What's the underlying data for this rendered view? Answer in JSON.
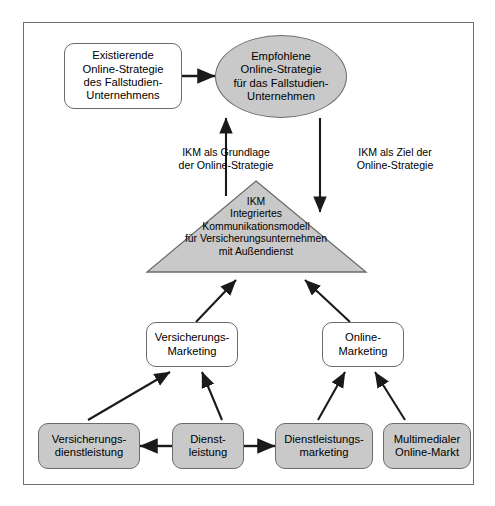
{
  "diagram": {
    "title_hidden": "",
    "colors": {
      "frame_border": "#6d6d6d",
      "node_border": "#6b6b6b",
      "gray_fill": "#c9c9c9",
      "white_fill": "#ffffff",
      "stroke": "#1a1a1a",
      "background": "#ffffff"
    },
    "nodes": {
      "existing_strategy": {
        "label": "Existierende\nOnline-Strategie\ndes Fallstudien-\nUnternehmens",
        "shape": "rounded-rect",
        "fill": "white"
      },
      "recommended_strategy": {
        "label": "Empfohlene\nOnline-Strategie\nfür das Fallstudien-\nUnternehmen",
        "shape": "ellipse",
        "fill": "gray"
      },
      "ikm_triangle": {
        "label": "IKM\nIntegriertes\nKommunikationsmodell\nfür Versicherungsunternehmen\nmit Außendienst",
        "shape": "triangle",
        "fill": "gray"
      },
      "versicherungs_marketing": {
        "label": "Versicherungs-\nMarketing",
        "shape": "rounded-rect",
        "fill": "white"
      },
      "online_marketing": {
        "label": "Online-\nMarketing",
        "shape": "rounded-rect",
        "fill": "white"
      },
      "versicherungsdienstleistung": {
        "label": "Versicherungs-\ndienstleistung",
        "shape": "rounded-rect",
        "fill": "gray"
      },
      "dienstleistung": {
        "label": "Dienst-\nleistung",
        "shape": "rounded-rect",
        "fill": "gray"
      },
      "dienstleistungsmarketing": {
        "label": "Dienstleistungs-\nmarketing",
        "shape": "rounded-rect",
        "fill": "gray"
      },
      "multimedialer_online_markt": {
        "label": "Multimedialer\nOnline-Markt",
        "shape": "rounded-rect",
        "fill": "gray"
      }
    },
    "edge_labels": {
      "left": "IKM als Grundlage\nder Online-Strategie",
      "right": "IKM als Ziel der\nOnline-Strategie"
    },
    "edges": [
      {
        "from": "existing_strategy",
        "to": "recommended_strategy",
        "direction": "right"
      },
      {
        "from": "ikm_triangle",
        "to": "recommended_strategy",
        "direction": "up",
        "label": "IKM als Grundlage der Online-Strategie"
      },
      {
        "from": "recommended_strategy",
        "to": "ikm_triangle",
        "direction": "down",
        "label": "IKM als Ziel der Online-Strategie"
      },
      {
        "from": "versicherungs_marketing",
        "to": "ikm_triangle",
        "direction": "up-right"
      },
      {
        "from": "online_marketing",
        "to": "ikm_triangle",
        "direction": "up-left"
      },
      {
        "from": "versicherungsdienstleistung",
        "to": "versicherungs_marketing",
        "direction": "up-right"
      },
      {
        "from": "dienstleistung",
        "to": "versicherungs_marketing",
        "direction": "up-left"
      },
      {
        "from": "dienstleistungsmarketing",
        "to": "online_marketing",
        "direction": "up-right"
      },
      {
        "from": "multimedialer_online_markt",
        "to": "online_marketing",
        "direction": "up-left"
      },
      {
        "from": "dienstleistung",
        "to": "versicherungsdienstleistung",
        "direction": "left"
      },
      {
        "from": "dienstleistung",
        "to": "dienstleistungsmarketing",
        "direction": "right"
      }
    ]
  }
}
